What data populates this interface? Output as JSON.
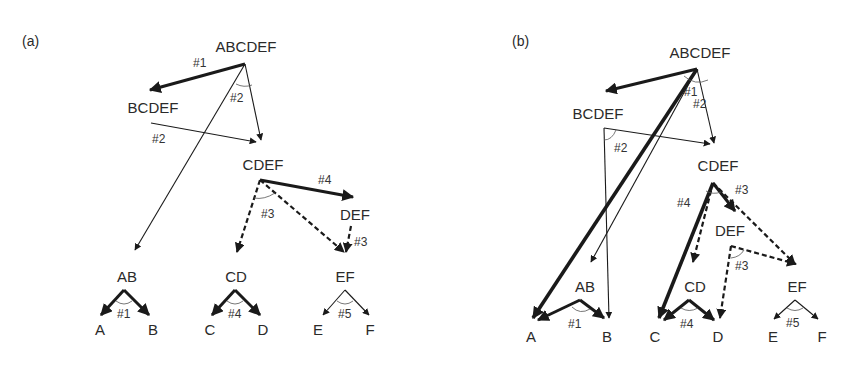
{
  "colors": {
    "ink": "#1a1a1a",
    "text": "#2a2a2a",
    "background": "#ffffff"
  },
  "panels": [
    {
      "id": "a",
      "label": "(a)",
      "label_pos": [
        22,
        46
      ],
      "nodes": [
        {
          "id": "ABCDEF",
          "text": "ABCDEF",
          "x": 246,
          "y": 52
        },
        {
          "id": "BCDEF",
          "text": "BCDEF",
          "x": 153,
          "y": 113
        },
        {
          "id": "CDEF",
          "text": "CDEF",
          "x": 263,
          "y": 170
        },
        {
          "id": "DEF",
          "text": "DEF",
          "x": 355,
          "y": 220
        },
        {
          "id": "AB",
          "text": "AB",
          "x": 127,
          "y": 282
        },
        {
          "id": "CD",
          "text": "CD",
          "x": 236,
          "y": 282
        },
        {
          "id": "EF",
          "text": "EF",
          "x": 345,
          "y": 282
        },
        {
          "id": "A",
          "text": "A",
          "x": 100,
          "y": 335
        },
        {
          "id": "B",
          "text": "B",
          "x": 153,
          "y": 335
        },
        {
          "id": "C",
          "text": "C",
          "x": 210,
          "y": 335
        },
        {
          "id": "D",
          "text": "D",
          "x": 263,
          "y": 335
        },
        {
          "id": "E",
          "text": "E",
          "x": 318,
          "y": 335
        },
        {
          "id": "F",
          "text": "F",
          "x": 370,
          "y": 335
        }
      ],
      "edges": [
        {
          "from": [
            245,
            64
          ],
          "to": [
            150,
            90
          ],
          "style": "thick"
        },
        {
          "from": [
            245,
            64
          ],
          "to": [
            261,
            140
          ],
          "style": "thin"
        },
        {
          "from": [
            245,
            64
          ],
          "to": [
            135,
            250
          ],
          "style": "thin"
        },
        {
          "from": [
            151,
            123
          ],
          "to": [
            256,
            142
          ],
          "style": "thin"
        },
        {
          "from": [
            260,
            180
          ],
          "to": [
            353,
            197
          ],
          "style": "thick"
        },
        {
          "from": [
            260,
            180
          ],
          "to": [
            237,
            252
          ],
          "style": "dashed"
        },
        {
          "from": [
            260,
            180
          ],
          "to": [
            344,
            252
          ],
          "style": "dashed"
        },
        {
          "from": [
            351,
            226
          ],
          "to": [
            346,
            252
          ],
          "style": "dashed"
        },
        {
          "from": [
            124,
            290
          ],
          "to": [
            101,
            315
          ],
          "style": "thick"
        },
        {
          "from": [
            124,
            290
          ],
          "to": [
            149,
            315
          ],
          "style": "thick"
        },
        {
          "from": [
            235,
            290
          ],
          "to": [
            212,
            315
          ],
          "style": "thick"
        },
        {
          "from": [
            235,
            290
          ],
          "to": [
            260,
            315
          ],
          "style": "thick"
        },
        {
          "from": [
            345,
            290
          ],
          "to": [
            323,
            315
          ],
          "style": "thin"
        },
        {
          "from": [
            345,
            290
          ],
          "to": [
            369,
            315
          ],
          "style": "thin"
        }
      ],
      "arcs": [
        {
          "d": "M 236 84 Q 244 88 252 85"
        },
        {
          "d": "M 254 198 Q 264 200 275 193"
        },
        {
          "d": "M 116 301 Q 124 307 132 301"
        },
        {
          "d": "M 227 301 Q 235 307 243 301"
        },
        {
          "d": "M 337 301 Q 345 307 353 301"
        }
      ],
      "labels": [
        {
          "text": "#1",
          "x": 193,
          "y": 67
        },
        {
          "text": "#2",
          "x": 230,
          "y": 102
        },
        {
          "text": "#2",
          "x": 152,
          "y": 143
        },
        {
          "text": "#4",
          "x": 318,
          "y": 184
        },
        {
          "text": "#3",
          "x": 261,
          "y": 218
        },
        {
          "text": "#3",
          "x": 354,
          "y": 246
        },
        {
          "text": "#1",
          "x": 117,
          "y": 318
        },
        {
          "text": "#4",
          "x": 228,
          "y": 318
        },
        {
          "text": "#5",
          "x": 338,
          "y": 318
        }
      ]
    },
    {
      "id": "b",
      "label": "(b)",
      "label_pos": [
        512,
        46
      ],
      "nodes": [
        {
          "id": "ABCDEF",
          "text": "ABCDEF",
          "x": 700,
          "y": 58
        },
        {
          "id": "BCDEF",
          "text": "BCDEF",
          "x": 598,
          "y": 119
        },
        {
          "id": "CDEF",
          "text": "CDEF",
          "x": 718,
          "y": 171
        },
        {
          "id": "DEF",
          "text": "DEF",
          "x": 730,
          "y": 236
        },
        {
          "id": "AB",
          "text": "AB",
          "x": 585,
          "y": 292
        },
        {
          "id": "CD",
          "text": "CD",
          "x": 695,
          "y": 292
        },
        {
          "id": "EF",
          "text": "EF",
          "x": 797,
          "y": 292
        },
        {
          "id": "A",
          "text": "A",
          "x": 531,
          "y": 342
        },
        {
          "id": "B",
          "text": "B",
          "x": 607,
          "y": 342
        },
        {
          "id": "C",
          "text": "C",
          "x": 655,
          "y": 342
        },
        {
          "id": "D",
          "text": "D",
          "x": 718,
          "y": 342
        },
        {
          "id": "E",
          "text": "E",
          "x": 773,
          "y": 342
        },
        {
          "id": "F",
          "text": "F",
          "x": 822,
          "y": 342
        }
      ],
      "edges": [
        {
          "from": [
            697,
            69
          ],
          "to": [
            606,
            91
          ],
          "style": "thick"
        },
        {
          "from": [
            697,
            69
          ],
          "to": [
            714,
            143
          ],
          "style": "thin"
        },
        {
          "from": [
            697,
            69
          ],
          "to": [
            533,
            318
          ],
          "style": "xthick"
        },
        {
          "from": [
            697,
            69
          ],
          "to": [
            591,
            262
          ],
          "style": "thin"
        },
        {
          "from": [
            604,
            128
          ],
          "to": [
            710,
            144
          ],
          "style": "thin"
        },
        {
          "from": [
            604,
            128
          ],
          "to": [
            609,
            318
          ],
          "style": "thin"
        },
        {
          "from": [
            713,
            183
          ],
          "to": [
            659,
            318
          ],
          "style": "xthick"
        },
        {
          "from": [
            713,
            183
          ],
          "to": [
            735,
            211
          ],
          "style": "thick"
        },
        {
          "from": [
            713,
            183
          ],
          "to": [
            693,
            262
          ],
          "style": "dashed"
        },
        {
          "from": [
            713,
            183
          ],
          "to": [
            795,
            264
          ],
          "style": "dashed"
        },
        {
          "from": [
            731,
            246
          ],
          "to": [
            796,
            264
          ],
          "style": "dashed"
        },
        {
          "from": [
            731,
            246
          ],
          "to": [
            720,
            318
          ],
          "style": "dashed"
        },
        {
          "from": [
            580,
            300
          ],
          "to": [
            538,
            320
          ],
          "style": "thick"
        },
        {
          "from": [
            580,
            300
          ],
          "to": [
            604,
            318
          ],
          "style": "thick"
        },
        {
          "from": [
            689,
            300
          ],
          "to": [
            664,
            320
          ],
          "style": "thick"
        },
        {
          "from": [
            689,
            300
          ],
          "to": [
            714,
            320
          ],
          "style": "thick"
        },
        {
          "from": [
            795,
            300
          ],
          "to": [
            774,
            319
          ],
          "style": "thin"
        },
        {
          "from": [
            795,
            300
          ],
          "to": [
            818,
            319
          ],
          "style": "thin"
        }
      ],
      "arcs": [
        {
          "d": "M 684 76 Q 695 86 708 80"
        },
        {
          "d": "M 604 140 Q 612 140 616 130"
        },
        {
          "d": "M 706 191 Q 713 195 721 192"
        },
        {
          "d": "M 731 258 Q 740 257 744 250"
        },
        {
          "d": "M 572 307 Q 580 315 590 309"
        },
        {
          "d": "M 681 308 Q 689 313 698 308"
        },
        {
          "d": "M 787 308 Q 795 313 803 308"
        }
      ],
      "labels": [
        {
          "text": "#1",
          "x": 684,
          "y": 96
        },
        {
          "text": "#2",
          "x": 693,
          "y": 108
        },
        {
          "text": "#2",
          "x": 614,
          "y": 152
        },
        {
          "text": "#3",
          "x": 735,
          "y": 194
        },
        {
          "text": "#4",
          "x": 677,
          "y": 207
        },
        {
          "text": "#3",
          "x": 735,
          "y": 270
        },
        {
          "text": "#1",
          "x": 568,
          "y": 328
        },
        {
          "text": "#4",
          "x": 680,
          "y": 328
        },
        {
          "text": "#5",
          "x": 786,
          "y": 327
        }
      ]
    }
  ]
}
